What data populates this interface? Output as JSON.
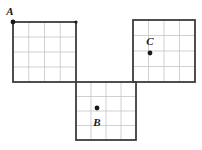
{
  "figure": {
    "background_color": "#ffffff",
    "outline_color": "#3c3c3c",
    "gridline_color": "#bdbdbd",
    "point_color": "#1a1a1a",
    "label_color": "#1a1a1a",
    "outline_width": 1.8,
    "gridline_width": 0.7,
    "point_radius": 2.4,
    "grid_divisions": 4
  },
  "squares": [
    {
      "id": "square-left",
      "name": "left-square",
      "x": 13,
      "y": 22,
      "width": 63,
      "height": 60
    },
    {
      "id": "square-bottom",
      "name": "bottom-square",
      "x": 76,
      "y": 82,
      "width": 60,
      "height": 58
    },
    {
      "id": "square-right",
      "name": "right-square",
      "x": 133,
      "y": 20,
      "width": 62,
      "height": 62
    }
  ],
  "points": [
    {
      "id": "point-a",
      "label": "A",
      "x": 13,
      "y": 22,
      "label_x": 10,
      "label_y": 15,
      "label_anchor": "middle",
      "in_square": "square-left",
      "position_note": "top-left corner vertex of left square"
    },
    {
      "id": "point-b",
      "label": "B",
      "x": 97,
      "y": 108,
      "label_x": 97,
      "label_y": 126,
      "label_anchor": "middle",
      "in_square": "square-bottom",
      "position_note": "interior of bottom square, one cell right and one cell down from its top-left"
    },
    {
      "id": "point-c",
      "label": "C",
      "x": 150,
      "y": 53,
      "label_x": 150,
      "label_y": 45,
      "label_anchor": "middle",
      "in_square": "square-right",
      "position_note": "interior of right square, one cell right and one cell down from its top-left"
    }
  ],
  "extra_marks": [
    {
      "id": "vertex-dot-top-middle",
      "name": "top-middle-vertex-dot",
      "x": 76,
      "y": 22,
      "radius": 1.6
    }
  ]
}
